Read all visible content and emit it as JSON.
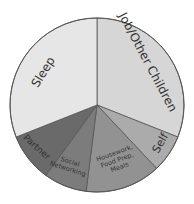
{
  "chart_data": {
    "type": "pie",
    "title": "",
    "start_angle_deg": 0,
    "direction": "clockwise",
    "center": [
      97,
      105
    ],
    "radius": 87,
    "slices": [
      {
        "label": "Job/Other Children",
        "lines": [
          "Job/Other Children"
        ],
        "percent": 31,
        "color": "#d6d6d6",
        "font_size": 12,
        "label_pos": [
          148,
          62
        ],
        "label_rotate": 62
      },
      {
        "label": "Self",
        "lines": [
          "Self"
        ],
        "percent": 7,
        "color": "#ababab",
        "font_size": 11,
        "label_pos": [
          160,
          143
        ],
        "label_rotate": -60
      },
      {
        "label": "Housework, Food Prep, Meals",
        "lines": [
          "Housework,",
          "Food Prep,",
          "Meals"
        ],
        "percent": 14,
        "color": "#929292",
        "font_size": 6.5,
        "label_pos": [
          117,
          160
        ],
        "label_rotate": -20
      },
      {
        "label": "Social Networking",
        "lines": [
          "Social",
          "Networking"
        ],
        "percent": 8,
        "color": "#7c7c7c",
        "font_size": 6.5,
        "label_pos": [
          69,
          165
        ],
        "label_rotate": 18
      },
      {
        "label": "Partner",
        "lines": [
          "Partner"
        ],
        "percent": 9,
        "color": "#6a6a6a",
        "font_size": 9,
        "label_pos": [
          37,
          147
        ],
        "label_rotate": 42
      },
      {
        "label": "Sleep",
        "lines": [
          "Sleep"
        ],
        "percent": 31,
        "color": "#e6e6e6",
        "font_size": 12,
        "label_pos": [
          43,
          72
        ],
        "label_rotate": -58
      }
    ],
    "categories": [
      "Job/Other Children",
      "Self",
      "Housework, Food Prep, Meals",
      "Social Networking",
      "Partner",
      "Sleep"
    ],
    "values": [
      31,
      7,
      14,
      8,
      9,
      31
    ],
    "legend": "none (labels inside slices)",
    "stroke_color": "#555555"
  }
}
